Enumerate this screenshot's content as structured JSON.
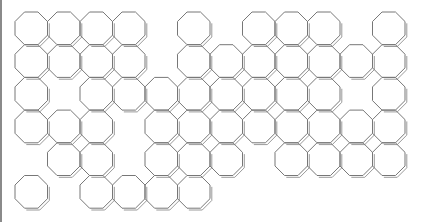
{
  "diagram": {
    "title": "",
    "shape": "octagon",
    "grid": {
      "origin_x": 15,
      "origin_y": 12,
      "cell_w": 32.5,
      "cell_h": 32.7,
      "cols": 12,
      "rows": 6
    },
    "colors": {
      "stroke": "#777777",
      "shadow": "#9a9a9a",
      "fill": "#ffffff",
      "border": "#8a8a8a"
    },
    "rows": [
      {
        "row": 0,
        "cols": [
          0,
          1,
          2,
          3,
          5,
          7,
          8,
          9,
          11
        ]
      },
      {
        "row": 1,
        "cols": [
          0,
          1,
          2,
          3,
          5,
          6,
          7,
          8,
          9,
          10,
          11
        ]
      },
      {
        "row": 2,
        "cols": [
          0,
          2,
          3,
          4,
          5,
          6,
          7,
          8,
          9,
          11
        ]
      },
      {
        "row": 3,
        "cols": [
          0,
          1,
          2,
          4,
          5,
          6,
          7,
          8,
          9,
          10,
          11
        ]
      },
      {
        "row": 4,
        "cols": [
          1,
          2,
          4,
          5,
          6,
          8,
          9,
          10,
          11
        ]
      },
      {
        "row": 5,
        "cols": [
          0,
          2,
          3,
          4,
          5
        ]
      }
    ]
  }
}
